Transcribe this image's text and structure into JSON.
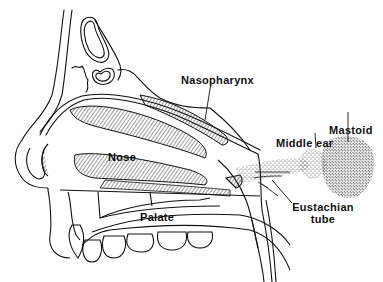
{
  "diagram": {
    "type": "anatomical-cross-section",
    "colors": {
      "ink": "#111111",
      "background": "#ffffff",
      "stipple": "#333333"
    },
    "labels": {
      "nasopharynx": "Nasopharynx",
      "nose": "Nose",
      "palate": "Palate",
      "middle_ear": "Middle ear",
      "mastoid": "Mastoid",
      "eustachian_line1": "Eustachian",
      "eustachian_line2": "tube"
    }
  }
}
